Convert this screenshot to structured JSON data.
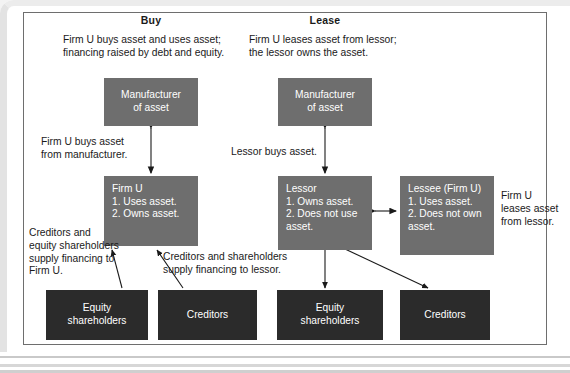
{
  "figure": {
    "columns": [
      {
        "title": "Buy"
      },
      {
        "title": "Lease"
      }
    ],
    "captions": {
      "buy": "Firm U buys asset and uses asset;\nfinancing raised by debt and equity.",
      "lease": "Firm U leases asset from lessor;\nthe lessor owns the asset."
    },
    "boxes": {
      "buy_manufacturer": "Manufacturer\nof asset",
      "lease_manufacturer": "Manufacturer\nof asset",
      "firm_u": "Firm U\n1. Uses asset.\n2. Owns asset.",
      "lessor": "Lessor\n1. Owns asset.\n2. Does not use\n    asset.",
      "lessee": "Lessee (Firm U)\n1. Uses asset.\n2. Does not own\n    asset.",
      "buy_equity_shareholders": "Equity\nshareholders",
      "buy_creditors": "Creditors",
      "lease_equity_shareholders": "Equity\nshareholders",
      "lease_creditors": "Creditors"
    },
    "annotations": {
      "firm_u_buys_asset": "Firm U buys asset\nfrom manufacturer.",
      "lessor_buys_asset": "Lessor buys asset.",
      "creditors_and_equity_finance_firm_u": "Creditors and\nequity shareholders\nsupply financing to\nFirm U.",
      "creditors_and_shareholders_finance_lessor": "Creditors and shareholders\nsupply financing to lessor.",
      "firm_u_leases_asset": "Firm U\nleases asset\nfrom lessor."
    },
    "colors": {
      "box_gray": "#6e6e6e",
      "box_dark": "#2b2b2b",
      "text_on_box": "#ffffff",
      "frame_border": "#6e6e6e",
      "body_text": "#1a1a1a",
      "arrow": "#1a1a1a"
    }
  }
}
